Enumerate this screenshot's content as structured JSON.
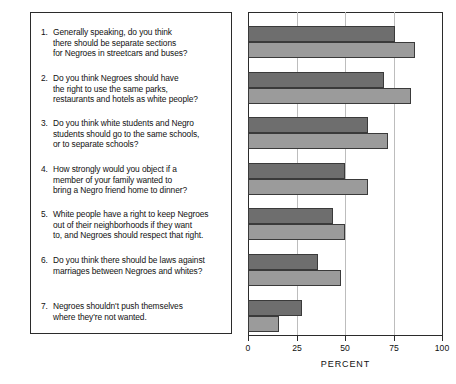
{
  "chart_data": {
    "type": "bar",
    "orientation": "horizontal",
    "title": "",
    "xlabel": "PERCENT",
    "ylabel": "",
    "xlim": [
      0,
      100
    ],
    "xticks": [
      0,
      25,
      50,
      75,
      100
    ],
    "xtick_labels": [
      "0",
      "25",
      "50",
      "75",
      "100"
    ],
    "grid": true,
    "grid_axis": "x",
    "legend": "none",
    "categories": [
      "1. Generally speaking, do you think there should be separate sections for Negroes in streetcars and buses?",
      "2. Do you think Negroes should have the right to use the same parks, restaurants and hotels as white people?",
      "3. Do you think white students and Negro students should go to the same schools, or to separate schools?",
      "4. How strongly would you object if a member of your family wanted to bring a Negro friend home to dinner?",
      "5. White people have a right to keep Negroes out of their neighborhoods if they want to, and Negroes should respect that right.",
      "6. Do you think there should be laws against marriages between Negroes and whites?",
      "7. Negroes shouldn't push themselves where they're not wanted."
    ],
    "series": [
      {
        "name": "dark",
        "color": "#6e6e6e",
        "values": [
          76,
          70,
          62,
          50,
          44,
          36,
          28
        ]
      },
      {
        "name": "light",
        "color": "#9b9b9b",
        "values": [
          86,
          84,
          72,
          62,
          50,
          48,
          16
        ]
      }
    ]
  },
  "questions": [
    {
      "number": "1.",
      "lines": [
        "Generally speaking, do you think",
        "there should be separate sections",
        "for Negroes in streetcars and buses?"
      ]
    },
    {
      "number": "2.",
      "lines": [
        "Do you think Negroes should have",
        "the right to use the same parks,",
        "restaurants and hotels as white people?"
      ]
    },
    {
      "number": "3.",
      "lines": [
        "Do you think white students and Negro",
        "students should go to the same schools,",
        "or to separate schools?"
      ]
    },
    {
      "number": "4.",
      "lines": [
        "How strongly would you object if a",
        "member of your family wanted to",
        "bring a Negro friend home to dinner?"
      ]
    },
    {
      "number": "5.",
      "lines": [
        "White people have a right to keep Negroes",
        "out of their neighborhoods if they want",
        "to, and Negroes should respect that right."
      ]
    },
    {
      "number": "6.",
      "lines": [
        "Do you think there should be laws against",
        "marriages between Negroes and whites?"
      ]
    },
    {
      "number": "7.",
      "lines": [
        "Negroes shouldn't push themselves",
        "where they're not wanted."
      ]
    }
  ],
  "axis": {
    "xlabel": "PERCENT",
    "tick_labels": [
      "0",
      "25",
      "50",
      "75",
      "100"
    ]
  },
  "colors": {
    "bar_dark": "#6e6e6e",
    "bar_light": "#9b9b9b",
    "bar_border": "#3a3a3a",
    "gridline": "#bdbdbd",
    "frame": "#2b2b2b",
    "background": "#ffffff"
  }
}
